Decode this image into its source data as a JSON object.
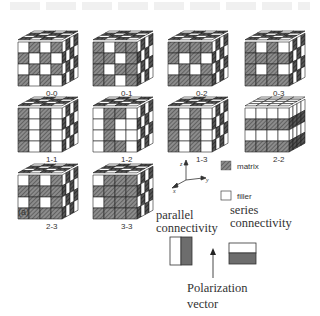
{
  "figure": {
    "panel_label": "(a)",
    "cubes": [
      {
        "id": "0-0",
        "label": "0-0",
        "pattern": "checker3d",
        "row": 0,
        "col": 0
      },
      {
        "id": "0-1",
        "label": "0-1",
        "pattern": "0-1",
        "row": 0,
        "col": 1
      },
      {
        "id": "0-2",
        "label": "0-2",
        "pattern": "0-2",
        "row": 0,
        "col": 2
      },
      {
        "id": "0-3",
        "label": "0-3",
        "pattern": "0-3",
        "row": 0,
        "col": 3
      },
      {
        "id": "1-1",
        "label": "1-1",
        "pattern": "1-1",
        "row": 1,
        "col": 0
      },
      {
        "id": "1-2",
        "label": "1-2",
        "pattern": "1-2",
        "row": 1,
        "col": 1
      },
      {
        "id": "1-3",
        "label": "1-3",
        "pattern": "1-3",
        "row": 1,
        "col": 2
      },
      {
        "id": "2-2",
        "label": "2-2",
        "pattern": "2-2",
        "row": 1,
        "col": 3
      },
      {
        "id": "2-3",
        "label": "2-3",
        "pattern": "2-3",
        "row": 2,
        "col": 0
      },
      {
        "id": "3-3",
        "label": "3-3",
        "pattern": "3-3",
        "row": 2,
        "col": 1
      }
    ],
    "axes": {
      "z": "z",
      "y": "y",
      "x": "x"
    },
    "legend": [
      {
        "swatch": "hatched",
        "label": "matrix"
      },
      {
        "swatch": "white",
        "label": "filler"
      }
    ],
    "connectivity": {
      "parallel_line1": "parallel",
      "parallel_line2": "connectivity",
      "series_line1": "series",
      "series_line2": "connectivity",
      "polarization_line1": "Polarization",
      "polarization_line2": "vector"
    },
    "colors": {
      "matrix_fill": "#7a7a7a",
      "dark_side": "#3a3a3a",
      "filler": "#ffffff",
      "stroke": "#222222"
    }
  }
}
